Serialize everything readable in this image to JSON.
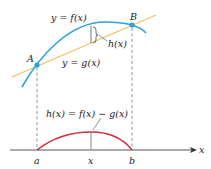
{
  "diagram": {
    "colors": {
      "f_curve": "#2aa3d8",
      "g_line": "#f0c060",
      "h_curve": "#d8283c",
      "axis": "#444444",
      "dash": "#555555",
      "point": "#2aa3d8"
    },
    "labels": {
      "f": "y = f(x)",
      "g": "y = g(x)",
      "h_short": "h(x)",
      "h_def": "h(x) = f(x) − g(x)",
      "point_A": "A",
      "point_B": "B",
      "tick_a": "a",
      "tick_x": "x",
      "tick_b": "b",
      "axis_x": "x"
    }
  }
}
